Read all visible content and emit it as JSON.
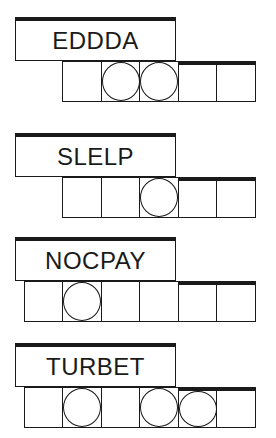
{
  "puzzles": [
    {
      "scrambled": "EDDDA",
      "length": 5,
      "circled": [
        2,
        3
      ]
    },
    {
      "scrambled": "SLELP",
      "length": 5,
      "circled": [
        3
      ]
    },
    {
      "scrambled": "NOCPAY",
      "length": 6,
      "circled": [
        2
      ]
    },
    {
      "scrambled": "TURBET",
      "length": 6,
      "circled": [
        2,
        4,
        5
      ]
    }
  ],
  "colors": {
    "ink": "#1a1a1a",
    "background": "#ffffff"
  }
}
